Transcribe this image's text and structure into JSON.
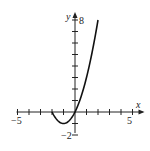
{
  "chart_data": {
    "type": "line",
    "title": "",
    "xlabel": "x",
    "ylabel": "y",
    "xlim": [
      -5,
      5
    ],
    "ylim": [
      -2,
      8
    ],
    "grid": false,
    "x_tick_labels": [
      "-5",
      "5"
    ],
    "y_tick_labels": [
      "-2",
      "8"
    ],
    "series": [
      {
        "name": "f(x) = x^2 + 2x",
        "x": [
          -2,
          -1.5,
          -1,
          -0.5,
          0,
          0.5,
          1,
          1.5,
          2
        ],
        "y": [
          0,
          -0.75,
          -1,
          -0.75,
          0,
          1.25,
          3,
          5.25,
          8
        ]
      }
    ],
    "colors": {
      "curve": "#111111",
      "axes": "#222222"
    }
  },
  "labels": {
    "x_axis": "x",
    "y_axis": "y",
    "x_min": "−5",
    "x_max": "5",
    "y_min": "−2",
    "y_max": "8"
  }
}
